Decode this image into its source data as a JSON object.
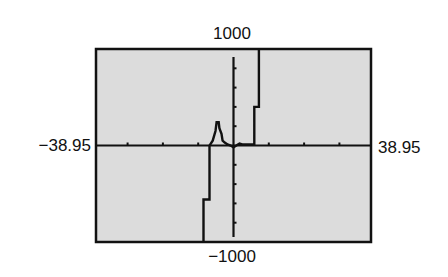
{
  "chart_data": {
    "type": "line",
    "title": "",
    "xlabel": "",
    "ylabel": "",
    "style": "graphing-calculator-screen",
    "window": {
      "xmin": -38.95,
      "xmax": 38.95,
      "ymin": -1000,
      "ymax": 1000,
      "xscl": 10,
      "yscl": 200
    },
    "labels": {
      "xmin": "−38.95",
      "xmax": "38.95",
      "ymin": "−1000",
      "ymax": "1000"
    },
    "grid": false,
    "legend": null,
    "colors": {
      "screen_bg": "#dcdcdc",
      "frame": "#111111",
      "axes": "#111111",
      "curve": "#111111",
      "page_bg": "#ffffff"
    },
    "series": [
      {
        "name": "y1",
        "points": [
          [
            -8.5,
            -1000
          ],
          [
            -8.5,
            -560
          ],
          [
            -6.8,
            -560
          ],
          [
            -6.8,
            0
          ],
          [
            -5.9,
            50
          ],
          [
            -5.1,
            150
          ],
          [
            -4.8,
            240
          ],
          [
            -4.2,
            240
          ],
          [
            -4.0,
            180
          ],
          [
            -3.4,
            120
          ],
          [
            -3.1,
            50
          ],
          [
            -2.5,
            30
          ],
          [
            -1.7,
            10
          ],
          [
            -0.8,
            0
          ],
          [
            0.0,
            -20
          ],
          [
            0.8,
            0
          ],
          [
            1.7,
            20
          ],
          [
            2.5,
            10
          ],
          [
            4.2,
            10
          ],
          [
            5.9,
            10
          ],
          [
            5.9,
            400
          ],
          [
            7.2,
            400
          ],
          [
            7.2,
            1000
          ]
        ]
      }
    ]
  }
}
